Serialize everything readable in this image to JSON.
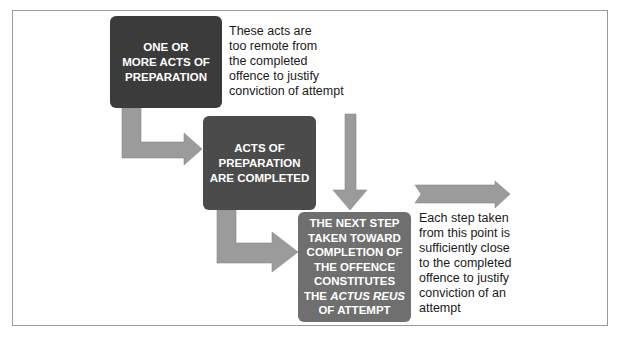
{
  "diagram": {
    "stages": [
      {
        "id": "stage-1",
        "lines": [
          "ONE OR",
          "MORE ACTS OF",
          "PREPARATION"
        ],
        "fill": "#3b3b3b"
      },
      {
        "id": "stage-2",
        "lines": [
          "ACTS OF",
          "PREPARATION",
          "ARE COMPLETED"
        ],
        "fill": "#4b4b4b"
      },
      {
        "id": "stage-3",
        "lines": [
          "THE NEXT STEP",
          "TAKEN TOWARD",
          "COMPLETION OF",
          "THE OFFENCE",
          "CONSTITUTES",
          "THE ",
          "ACTUS REUS",
          "OF ATTEMPT"
        ],
        "fill": "#6f6f6f"
      }
    ],
    "notes": [
      {
        "id": "note-before",
        "lines": [
          "These acts are",
          "too remote from",
          "the completed",
          "offence to justify",
          "conviction of attempt"
        ]
      },
      {
        "id": "note-after",
        "lines": [
          "Each step taken",
          "from this point is",
          "sufficiently close",
          "to the completed",
          "offence to justify",
          "conviction of an",
          "attempt"
        ]
      }
    ],
    "colors": {
      "arrow": "#9b9b9b",
      "frame_border": "#9a9a9a",
      "text_dark": "#1a1a1a"
    }
  }
}
